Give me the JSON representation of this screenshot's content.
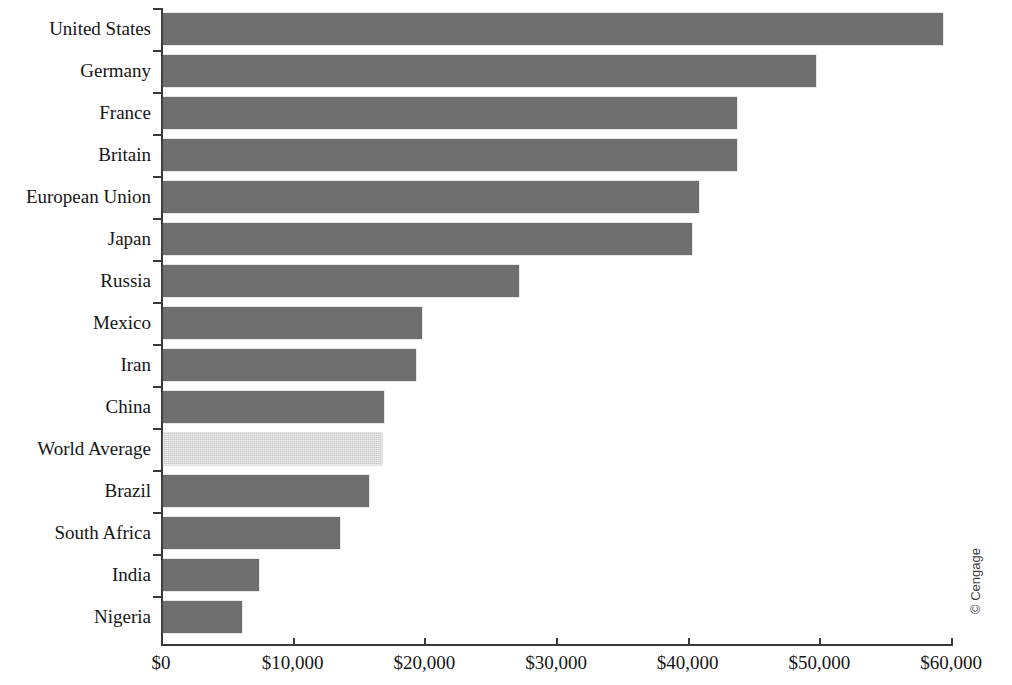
{
  "chart_data": {
    "type": "bar",
    "orientation": "horizontal",
    "title": "",
    "subtitle": "",
    "xlabel": "",
    "ylabel": "",
    "xlim": [
      0,
      60000
    ],
    "xticks": [
      0,
      10000,
      20000,
      30000,
      40000,
      50000,
      60000
    ],
    "xtick_labels": [
      "$0",
      "$10,000",
      "$20,000",
      "$30,000",
      "$40,000",
      "$50,000",
      "$60,000"
    ],
    "grid": false,
    "legend": null,
    "categories": [
      "United States",
      "Germany",
      "France",
      "Britain",
      "European Union",
      "Japan",
      "Russia",
      "Mexico",
      "Iran",
      "China",
      "World Average",
      "Brazil",
      "South Africa",
      "India",
      "Nigeria"
    ],
    "values": [
      59250,
      49580,
      43570,
      43570,
      40680,
      40150,
      27070,
      19700,
      19240,
      16810,
      16650,
      15670,
      13460,
      7300,
      6010
    ],
    "highlight_category": "World Average",
    "colors": {
      "bar": "#6e6e6e",
      "bar_highlight": "#c2c2c2",
      "axis": "#3a3a3a",
      "text": "#151515",
      "background": "#ffffff"
    }
  },
  "credit": {
    "text": "© Cengage"
  }
}
